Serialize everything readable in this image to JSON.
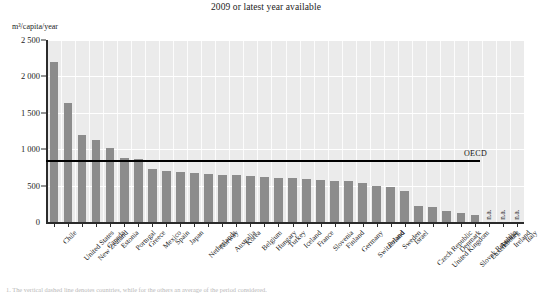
{
  "chart_data": {
    "type": "bar",
    "title": "2009 or latest year available",
    "xlabel": "",
    "ylabel": "m³/capita/year",
    "ylim": [
      0,
      2500
    ],
    "yticks": [
      0,
      500,
      1000,
      1500,
      2000,
      2500
    ],
    "ytick_labels": [
      "0",
      "500",
      "1 000",
      "1 500",
      "2 000",
      "2 500"
    ],
    "grid": true,
    "legend": "none",
    "bar_color": "#8c8c8c",
    "plot_background": "#ebebeb",
    "categories": [
      "Chile",
      "United States",
      "New Zealand",
      "Canada",
      "Estonia",
      "Portugal",
      "Greece",
      "Mexico",
      "Spain",
      "Japan",
      "Netherlands",
      "Norway",
      "Australia",
      "Korea",
      "Belgium",
      "Hungary",
      "Turkey",
      "Iceland",
      "France",
      "Slovenia",
      "Finland",
      "Germany",
      "Switzerland",
      "Poland",
      "Sweden",
      "Israel",
      "Czech Republic",
      "United Kingdom",
      "Denmark",
      "Slovak Republic",
      "Luxembourg",
      "Austria",
      "Ireland",
      "Italy"
    ],
    "values": [
      2200,
      1630,
      1200,
      1120,
      1020,
      880,
      870,
      730,
      700,
      690,
      680,
      660,
      650,
      640,
      630,
      620,
      610,
      600,
      590,
      580,
      570,
      560,
      540,
      500,
      480,
      430,
      215,
      205,
      150,
      120,
      95,
      null,
      null,
      null
    ],
    "missing_label": "n.a.",
    "missing_categories": [
      "Austria",
      "Ireland",
      "Italy"
    ],
    "annotations": [
      {
        "name": "oecd-average-line",
        "label": "OECD",
        "value": 850,
        "style": "horizontal-reference-line"
      }
    ],
    "footnote": "1. The vertical dashed line denotes countries, while for the others an average of the period considered."
  }
}
